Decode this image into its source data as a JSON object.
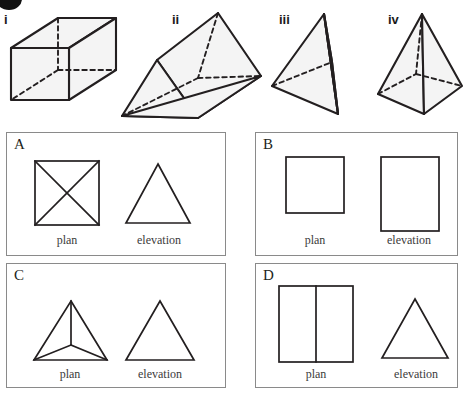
{
  "figure": {
    "top_row": {
      "solids": [
        {
          "id": "i",
          "label": "i",
          "name": "cuboid"
        },
        {
          "id": "ii",
          "label": "ii",
          "name": "triangular-prism"
        },
        {
          "id": "iii",
          "label": "iii",
          "name": "tetrahedron"
        },
        {
          "id": "iv",
          "label": "iv",
          "name": "square-pyramid"
        }
      ]
    },
    "panels": [
      {
        "letter": "A",
        "plan": {
          "caption": "plan",
          "shape": "square-with-both-diagonals"
        },
        "elevation": {
          "caption": "elevation",
          "shape": "triangle"
        }
      },
      {
        "letter": "B",
        "plan": {
          "caption": "plan",
          "shape": "square"
        },
        "elevation": {
          "caption": "elevation",
          "shape": "tall-rectangle"
        }
      },
      {
        "letter": "C",
        "plan": {
          "caption": "plan",
          "shape": "triangle-with-centre-point-joined-to-vertices"
        },
        "elevation": {
          "caption": "elevation",
          "shape": "triangle"
        }
      },
      {
        "letter": "D",
        "plan": {
          "caption": "plan",
          "shape": "rectangle-divided-by-vertical-line"
        },
        "elevation": {
          "caption": "elevation",
          "shape": "triangle"
        }
      }
    ],
    "colors": {
      "line": "#231f20",
      "panel_border": "#8a8a8a",
      "solid_fill": "#f4f4f4",
      "caption": "#3b3b3b"
    }
  }
}
